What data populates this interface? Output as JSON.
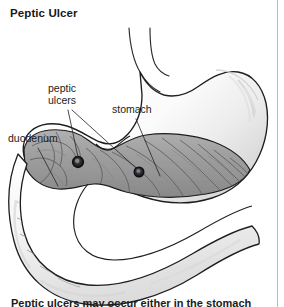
{
  "page": {
    "title": "Peptic Ulcer",
    "background_color": "#ffffff",
    "border_color": "#b9b9b9"
  },
  "figure": {
    "name": "peptic-ulcer-anatomical-diagram",
    "colors": {
      "outline": "#1e1e1e",
      "mucosa_fill": "#9a9a9a",
      "mucosa_fold": "#5d5d5d",
      "organ_light": "#f4f4f4",
      "shading": "#d8d8d8",
      "ulcer": "#14161a",
      "leader_line": "#2b2b2b"
    },
    "labels": [
      {
        "id": "peptic-ulcers",
        "line1": "peptic",
        "line2": "ulcers",
        "x": 48,
        "y": 83
      },
      {
        "id": "stomach",
        "text": "stomach",
        "x": 112,
        "y": 104
      },
      {
        "id": "duodenum",
        "text": "duodenum",
        "x": 8,
        "y": 133
      }
    ],
    "ulcers": [
      {
        "id": "duodenal-ulcer",
        "cx": 78,
        "cy": 162,
        "r": 5.2
      },
      {
        "id": "gastric-ulcer",
        "cx": 139,
        "cy": 172,
        "r": 4.6
      }
    ],
    "parts": [
      "esophagus",
      "stomach-fundus",
      "stomach-body",
      "stomach-antrum",
      "pylorus",
      "duodenal-bulb",
      "duodenum"
    ]
  },
  "caption": {
    "text": "Peptic ulcers may occur either in the stomach"
  }
}
